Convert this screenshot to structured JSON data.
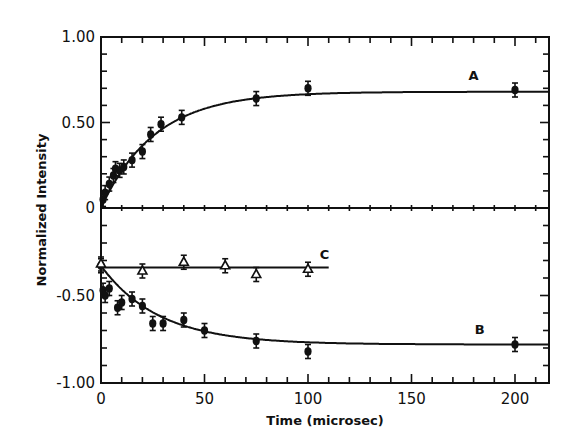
{
  "chart_data": {
    "type": "scatter",
    "title": "",
    "xlabel": "Time (microsec)",
    "ylabel": "Normalized Intensity",
    "xlim": [
      0,
      218
    ],
    "ylim": [
      -1.0,
      1.0
    ],
    "xticks": [
      0,
      50,
      100,
      150,
      200
    ],
    "yticks": [
      {
        "value": 1.0,
        "label": "1.00"
      },
      {
        "value": 0.5,
        "label": "0.50"
      },
      {
        "value": 0.0,
        "label": "0"
      },
      {
        "value": -0.5,
        "label": "-0.50"
      },
      {
        "value": -1.0,
        "label": "-1.00"
      }
    ],
    "grid": false,
    "legend": "inline curve labels",
    "series": [
      {
        "name": "A",
        "marker": "filled-circle",
        "fit": "rising exponential to plateau ~0.68",
        "points": [
          {
            "x": 1,
            "y": 0.05
          },
          {
            "x": 2,
            "y": 0.09
          },
          {
            "x": 4,
            "y": 0.14
          },
          {
            "x": 6,
            "y": 0.19
          },
          {
            "x": 7,
            "y": 0.23
          },
          {
            "x": 9,
            "y": 0.22
          },
          {
            "x": 11,
            "y": 0.24
          },
          {
            "x": 15,
            "y": 0.28
          },
          {
            "x": 20,
            "y": 0.33
          },
          {
            "x": 24,
            "y": 0.43
          },
          {
            "x": 29,
            "y": 0.49
          },
          {
            "x": 39,
            "y": 0.53
          },
          {
            "x": 75,
            "y": 0.64
          },
          {
            "x": 100,
            "y": 0.7
          },
          {
            "x": 200,
            "y": 0.69
          }
        ],
        "label_pos": {
          "x": 180,
          "y": 0.75
        }
      },
      {
        "name": "B",
        "marker": "filled-circle",
        "fit": "decaying exponential from -0.33 to ~-0.78",
        "points": [
          {
            "x": 0,
            "y": -0.33
          },
          {
            "x": 1,
            "y": -0.47
          },
          {
            "x": 2,
            "y": -0.5
          },
          {
            "x": 4,
            "y": -0.46
          },
          {
            "x": 8,
            "y": -0.57
          },
          {
            "x": 10,
            "y": -0.54
          },
          {
            "x": 15,
            "y": -0.52
          },
          {
            "x": 20,
            "y": -0.56
          },
          {
            "x": 25,
            "y": -0.66
          },
          {
            "x": 30,
            "y": -0.66
          },
          {
            "x": 40,
            "y": -0.64
          },
          {
            "x": 50,
            "y": -0.7
          },
          {
            "x": 75,
            "y": -0.76
          },
          {
            "x": 100,
            "y": -0.82
          },
          {
            "x": 200,
            "y": -0.78
          }
        ],
        "label_pos": {
          "x": 183,
          "y": -0.72
        }
      },
      {
        "name": "C",
        "marker": "triangle-circle",
        "fit": "flat line at ~-0.34 (0 to 110 µs)",
        "points": [
          {
            "x": 0,
            "y": -0.32
          },
          {
            "x": 20,
            "y": -0.36
          },
          {
            "x": 40,
            "y": -0.31
          },
          {
            "x": 60,
            "y": -0.33
          },
          {
            "x": 75,
            "y": -0.38
          },
          {
            "x": 100,
            "y": -0.35
          }
        ],
        "label_pos": {
          "x": 108,
          "y": -0.29
        }
      }
    ]
  }
}
